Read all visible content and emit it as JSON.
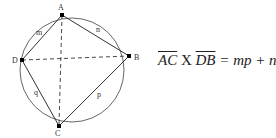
{
  "diagram": {
    "points": {
      "A": "A",
      "B": "B",
      "C": "C",
      "D": "D"
    },
    "side_labels": {
      "AD": "m",
      "AB": "n",
      "BC": "p",
      "CD": "q"
    },
    "stroke_color": "#333333"
  },
  "formula": {
    "lhs1": "AC",
    "times": " X ",
    "lhs2": "DB",
    "rhs": " = mp + nq"
  }
}
